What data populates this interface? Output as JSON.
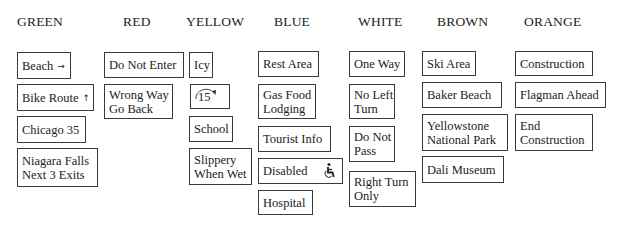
{
  "headers": {
    "green": "GREEN",
    "red": "RED",
    "yellow": "YELLOW",
    "blue": "BLUE",
    "white": "WHITE",
    "brown": "BROWN",
    "orange": "ORANGE"
  },
  "green": {
    "beach": "Beach",
    "beach_icon": "arrow-right-icon",
    "bike_route": "Bike Route",
    "bike_route_icon": "arrow-up-icon",
    "chicago": "Chicago 35",
    "niagara_line1": "Niagara Falls",
    "niagara_line2": "Next 3 Exits"
  },
  "red": {
    "do_not_enter": "Do Not Enter",
    "wrong_way_line1": "Wrong Way",
    "wrong_way_line2": "Go Back"
  },
  "yellow": {
    "icy": "Icy",
    "curve_speed": "15",
    "curve_speed_icon": "curved-arrow-icon",
    "school": "School",
    "slippery_line1": "Slippery",
    "slippery_line2": "When Wet"
  },
  "blue": {
    "rest_area": "Rest Area",
    "gas_line1": "Gas Food",
    "gas_line2": "Lodging",
    "tourist_info": "Tourist Info",
    "disabled": "Disabled",
    "disabled_icon": "wheelchair-icon",
    "hospital": "Hospital"
  },
  "white": {
    "one_way": "One Way",
    "no_left_line1": "No Left",
    "no_left_line2": "Turn",
    "do_not_pass_line1": "Do Not",
    "do_not_pass_line2": "Pass",
    "right_turn_line1": "Right Turn",
    "right_turn_line2": "Only"
  },
  "brown": {
    "ski_area": "Ski Area",
    "baker_beach": "Baker Beach",
    "yellowstone_line1": "Yellowstone",
    "yellowstone_line2": "National Park",
    "dali": "Dali Museum"
  },
  "orange": {
    "construction": "Construction",
    "flagman": "Flagman Ahead",
    "end_line1": "End",
    "end_line2": "Construction"
  }
}
